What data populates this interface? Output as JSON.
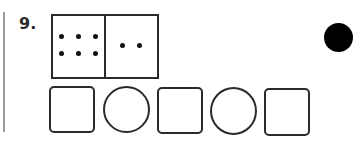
{
  "question": {
    "number": "9."
  },
  "domino": {
    "left_pips": 6,
    "right_pips": 2
  },
  "answer_shapes": [
    {
      "type": "square",
      "label": "answer-box-1"
    },
    {
      "type": "circle",
      "label": "operator-circle-1"
    },
    {
      "type": "square",
      "label": "answer-box-2"
    },
    {
      "type": "circle",
      "label": "operator-circle-2"
    },
    {
      "type": "square",
      "label": "answer-box-3"
    }
  ],
  "marker": {
    "type": "filled-circle",
    "color": "#000000"
  },
  "colors": {
    "stroke": "#2a2a2a",
    "margin_line": "#9a9a9a",
    "background": "#ffffff"
  }
}
